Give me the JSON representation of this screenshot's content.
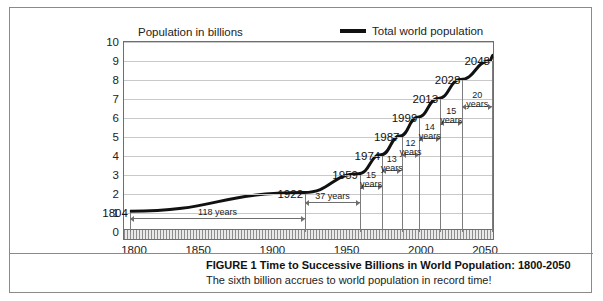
{
  "chart_data": {
    "type": "line",
    "title": "FIGURE 1  Time to Successive Billions in World Population: 1800-2050",
    "subtitle": "The sixth billion accrues to world population in record time!",
    "ylabel": "Population in billions",
    "xlabel": "",
    "xlim": [
      1800,
      2050
    ],
    "ylim": [
      0,
      10
    ],
    "grid": true,
    "legend_position": "top-right",
    "series": [
      {
        "name": "Total world population",
        "x": [
          1804,
          1922,
          1959,
          1974,
          1987,
          1999,
          2013,
          2028,
          2048
        ],
        "values": [
          1,
          2,
          3,
          4,
          5,
          6,
          7,
          8,
          9
        ]
      }
    ],
    "xticks": [
      1800,
      1850,
      1900,
      1950,
      2000,
      2050
    ],
    "yticks": [
      0,
      1,
      2,
      3,
      4,
      5,
      6,
      7,
      8,
      9,
      10
    ],
    "milestones": [
      {
        "year": "1804",
        "billions": 1
      },
      {
        "year": "1922",
        "billions": 2
      },
      {
        "year": "1959",
        "billions": 3
      },
      {
        "year": "1974",
        "billions": 4
      },
      {
        "year": "1987",
        "billions": 5
      },
      {
        "year": "1999",
        "billions": 6
      },
      {
        "year": "2013",
        "billions": 7
      },
      {
        "year": "2028",
        "billions": 8
      },
      {
        "year": "2048",
        "billions": 9
      }
    ],
    "intervals": [
      {
        "from": 1804,
        "to": 1922,
        "label": "118 years",
        "stacked": false
      },
      {
        "from": 1922,
        "to": 1959,
        "label": "37 years",
        "stacked": false
      },
      {
        "from": 1959,
        "to": 1974,
        "label": "15 years",
        "stacked": true
      },
      {
        "from": 1974,
        "to": 1987,
        "label": "13 years",
        "stacked": true
      },
      {
        "from": 1987,
        "to": 1999,
        "label": "12 years",
        "stacked": true
      },
      {
        "from": 1999,
        "to": 2013,
        "label": "14 years",
        "stacked": true
      },
      {
        "from": 2013,
        "to": 2028,
        "label": "15 years",
        "stacked": true
      },
      {
        "from": 2028,
        "to": 2048,
        "label": "20 years",
        "stacked": true
      }
    ]
  },
  "legend": {
    "label": "Total world population"
  },
  "colors": {
    "curve": "#111111",
    "grid": "#c9c9c9",
    "axis": "#6e6e6e",
    "border": "#8a8a8a"
  }
}
